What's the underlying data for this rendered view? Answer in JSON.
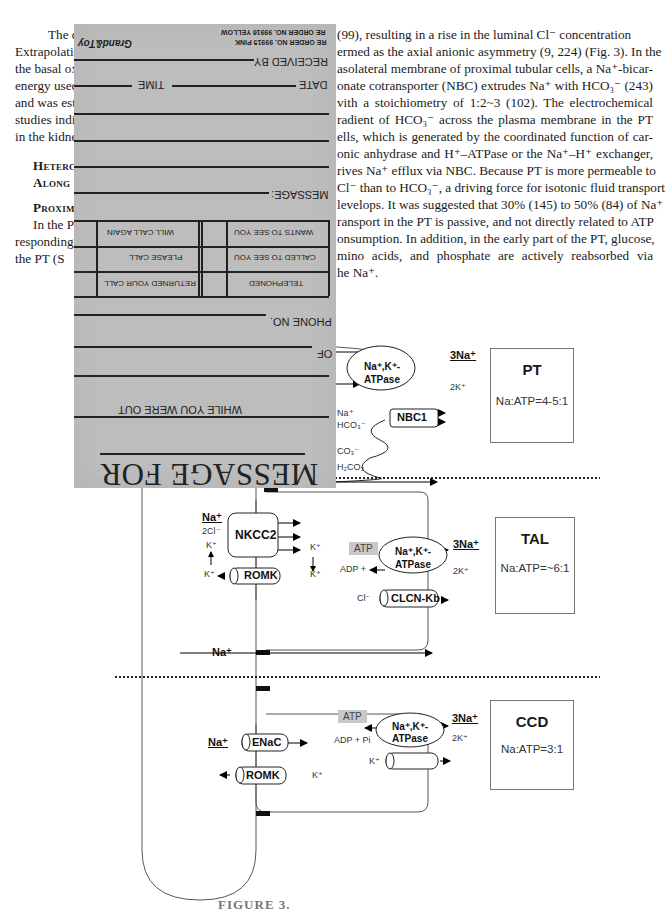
{
  "paper": {
    "left_column_fragments": [
      "The data",
      "Extrapolatio",
      "the basal ox",
      "energy usec",
      "and was est",
      "studies indic",
      "in the kidne"
    ],
    "left_first_line_top_right": "(99), resulting in a rise in the luminal Cl",
    "right_column_lines": [
      "(99), resulting in a rise in the luminal Cl⁻ concentration",
      "ermed as the axial anionic asymmetry (9, 224) (Fig. 3). In the",
      "asolateral membrane of proximal tubular cells, a Na⁺-bicar-",
      "onate cotransporter (NBC) extrudes Na⁺ with HCO₃⁻ (243)",
      "vith a stoichiometry of 1:2~3 (102). The electrochemical",
      "radient of HCO₃⁻ across the plasma membrane in the PT",
      "ells, which is generated by the coordinated function of car-",
      "onic anhydrase and H⁺–ATPase or the Na⁺–H⁺ exchanger,",
      "rives Na⁺ efflux via NBC. Because PT is more permeable to",
      "Cl⁻ than to HCO₃⁻, a driving force for isotonic fluid transport",
      "levelops. It was suggested that 30% (145) to 50% (84) of Na⁺",
      "ransport in the PT is passive, and not directly related to ATP",
      "onsumption. In addition, in the early part of the PT, glucose,",
      "mino acids, and phosphate are actively reabsorbed via",
      "he Na⁺."
    ],
    "section_heading_1": [
      "Heterc",
      "Along"
    ],
    "section_heading_2": "Proxim",
    "section_body_fragments": [
      "In the P",
      "responding",
      "the PT (S"
    ],
    "caption": "FIGURE 3."
  },
  "note_pad": {
    "brand": "Grand&Toy",
    "order_codes": [
      "RE ORDER NO. 99916 YELLOW",
      "RE ORDER NO. 99915 PINK"
    ],
    "fields": {
      "received_by": "RECEIVED BY",
      "date": "DATE",
      "time": "TIME",
      "message": "MESSAGE:",
      "phone_no": "PHONE NO.",
      "of": "OF",
      "while_you_were_out": "WHILE YOU WERE OUT",
      "message_for": "MESSAGE FOR"
    },
    "checkboxes": [
      {
        "label": "WANTS TO SEE YOU"
      },
      {
        "label": "WILL CALL AGAIN"
      },
      {
        "label": "CALLED TO SEE YOU"
      },
      {
        "label": "PLEASE CALL"
      },
      {
        "label": "TELEPHONED"
      },
      {
        "label": "RETURNED YOUR CALL"
      }
    ]
  },
  "diagram": {
    "segments": [
      {
        "name": "PT",
        "ratio": "Na:ATP=4-5:1"
      },
      {
        "name": "TAL",
        "ratio": "Na:ATP=~6:1"
      },
      {
        "name": "CCD",
        "ratio": "Na:ATP=3:1"
      }
    ],
    "pt": {
      "pump": [
        "Na⁺,K⁺-",
        "ATPase"
      ],
      "three_na": "3Na⁺",
      "two_k": "2K⁺",
      "nbc": "NBC1",
      "na": "Na⁺",
      "hco3": "HCO₃⁻",
      "o3": "CO₃⁻",
      "h2co3": "H₂CO₃"
    },
    "tal": {
      "nkcc2": "NKCC2",
      "na": "Na⁺",
      "two_cl": "2Cl⁻",
      "k": "K⁺",
      "romk": "ROMK",
      "atp": "ATP",
      "adp": "ADP +",
      "pump": [
        "Na⁺,K⁺-",
        "ATPase"
      ],
      "three_na": "3Na⁺",
      "two_k": "2K⁺",
      "cl": "Cl⁻",
      "clcn": "CLCN-Kb",
      "para_na": "Na⁺"
    },
    "ccd": {
      "na": "Na⁺",
      "enac": "ENaC",
      "romk": "ROMK",
      "k": "K⁺",
      "atp": "ATP",
      "adp": "ADP + Pi",
      "pump": [
        "Na⁺,K⁺-",
        "ATPase"
      ],
      "three_na": "3Na⁺",
      "two_k": "2K⁺"
    }
  }
}
